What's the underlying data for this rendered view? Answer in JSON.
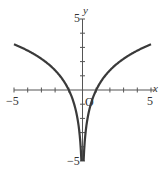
{
  "chart_data": {
    "type": "line",
    "title": "",
    "function": "y = 2 ln|x|",
    "xlabel": "x",
    "ylabel": "y",
    "xlim": [
      -5,
      5
    ],
    "ylim": [
      -5,
      5
    ],
    "x_tick_labels": [
      "-5",
      "5"
    ],
    "y_tick_labels": [
      "5",
      "-5"
    ],
    "origin_label": "O",
    "grid": false,
    "series": [
      {
        "name": "curve",
        "x": [
          -5,
          -4,
          -3,
          -2,
          -1.5,
          -1,
          -0.5,
          -0.3,
          -0.1,
          0.1,
          0.3,
          0.5,
          1,
          1.5,
          2,
          3,
          4,
          5
        ],
        "y": [
          3.22,
          2.77,
          2.2,
          1.39,
          0.81,
          0,
          -1.39,
          -2.41,
          -4.6,
          -4.6,
          -2.41,
          -1.39,
          0,
          0.81,
          1.39,
          2.2,
          2.77,
          3.22
        ]
      }
    ],
    "colors": {
      "curve": "#3a3a3a",
      "axes": "#555555"
    }
  },
  "labels": {
    "x_axis": "x",
    "y_axis": "y",
    "x_min": "−5",
    "x_max": "5",
    "y_max": "5",
    "y_min": "−5",
    "origin": "O"
  }
}
